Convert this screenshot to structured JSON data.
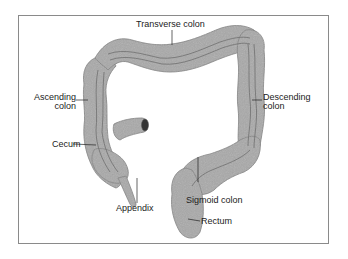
{
  "diagram": {
    "labels": {
      "transverse": "Transverse colon",
      "ascending_line1": "Ascending",
      "ascending_line2": "colon",
      "descending_line1": "Descending",
      "descending_line2": "colon",
      "cecum": "Cecum",
      "appendix": "Appendix",
      "sigmoid": "Sigmoid colon",
      "rectum": "Rectum"
    },
    "colors": {
      "colon_fill": "#a9a9a9",
      "colon_edge": "#7d7d7d",
      "inner_line": "#6f6f6f",
      "text": "#222222",
      "frame": "#8a8a8a"
    }
  }
}
